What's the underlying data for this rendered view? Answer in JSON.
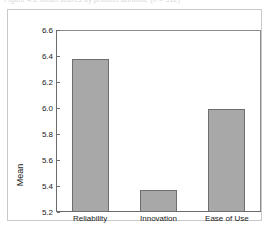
{
  "figure": {
    "clipped_caption": "Figure 4.2 Mean scores by product attribute (n = 312)",
    "background_color": "#ffffff",
    "border_color": "#c9c9c9"
  },
  "chart_data": {
    "type": "bar",
    "title": "",
    "xlabel": "",
    "ylabel": "Mean",
    "categories": [
      "Reliability",
      "Innovation",
      "Ease of Use"
    ],
    "values": [
      6.38,
      5.37,
      5.99
    ],
    "ylim": [
      5.2,
      6.6
    ],
    "ytick_labels": [
      "6.6",
      "6.4",
      "6.2",
      "6.0",
      "5.8",
      "5.6",
      "5.4",
      "5.2"
    ],
    "ytick_values": [
      6.6,
      6.4,
      6.2,
      6.0,
      5.8,
      5.6,
      5.4,
      5.2
    ],
    "ytick_interval": 0.2,
    "grid": false,
    "legend": false,
    "bar_fill_color": "#a8a8a8",
    "bar_edge_color": "#6e6e6e",
    "axis_color": "#6b6b6b",
    "plot_frame_color": "#8c8c8c",
    "text_color": "#1a1a1a"
  }
}
